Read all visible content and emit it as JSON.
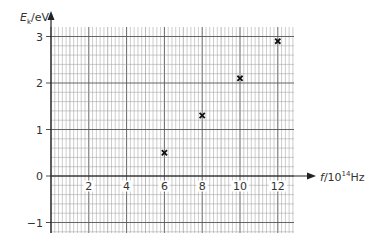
{
  "chart_data": {
    "type": "scatter",
    "title": "",
    "xlabel": "f/10^14Hz",
    "ylabel": "E_k/eV",
    "xlabel_parts": {
      "var": "f",
      "pre": "/10",
      "sup": "14",
      "post": "Hz"
    },
    "ylabel_parts": {
      "var": "E",
      "sub": "k",
      "post": "/eV"
    },
    "x_ticks": [
      2,
      4,
      6,
      8,
      10,
      12
    ],
    "y_ticks": [
      -1,
      0,
      1,
      2,
      3
    ],
    "xlim": [
      0,
      12.8
    ],
    "ylim": [
      -1.2,
      3.2
    ],
    "grid": true,
    "marker": "x",
    "series": [
      {
        "name": "data",
        "x": [
          6,
          8,
          10,
          12
        ],
        "y": [
          0.5,
          1.3,
          2.1,
          2.9
        ]
      }
    ]
  },
  "colors": {
    "grid_minor": "#9a9a9a",
    "grid_major": "#555555",
    "axis": "#222222",
    "marker": "#111111"
  }
}
